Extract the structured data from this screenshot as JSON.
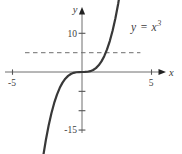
{
  "figure": {
    "equation": {
      "base": "y = x",
      "exponent": "3"
    }
  },
  "colors": {
    "curve": "#383838",
    "axis": "#6e6e6e",
    "tick": "#555555",
    "arrow": "#222222",
    "dashed": "#8a8a8a",
    "text": "#3d3d3d"
  },
  "chart_data": {
    "type": "line",
    "function": "y = x^3",
    "xlabel": "x",
    "ylabel": "y",
    "xlim": [
      -5.6,
      6.0
    ],
    "ylim": [
      -16.0,
      16.5
    ],
    "grid": false,
    "legend": false,
    "x_ticks": [
      {
        "value": -5,
        "label": "-5"
      },
      {
        "value": 5,
        "label": "5"
      }
    ],
    "y_ticks": [
      {
        "value": 10,
        "label": "10"
      },
      {
        "value": -5,
        "label": ""
      },
      {
        "value": -10,
        "label": ""
      },
      {
        "value": -15,
        "label": "-15"
      }
    ],
    "dashed_line": {
      "y": 5,
      "x_from": -4.1,
      "x_to": 4.2,
      "style": "dashed"
    },
    "series": [
      {
        "name": "y = x^3",
        "x": [
          -2.8,
          -2.6,
          -2.4,
          -2.2,
          -2.0,
          -1.8,
          -1.6,
          -1.4,
          -1.2,
          -1.0,
          -0.8,
          -0.6,
          -0.4,
          -0.2,
          0,
          0.2,
          0.4,
          0.6,
          0.8,
          1.0,
          1.2,
          1.4,
          1.6,
          1.8,
          2.0,
          2.2,
          2.4,
          2.6,
          2.8
        ],
        "y": [
          -21.952,
          -17.576,
          -13.824,
          -10.648,
          -8.0,
          -5.832,
          -4.096,
          -2.744,
          -1.728,
          -1.0,
          -0.512,
          -0.216,
          -0.064,
          -0.008,
          0,
          0.008,
          0.064,
          0.216,
          0.512,
          1.0,
          1.728,
          2.744,
          4.096,
          5.832,
          8.0,
          10.648,
          13.824,
          17.576,
          21.952
        ]
      }
    ]
  }
}
